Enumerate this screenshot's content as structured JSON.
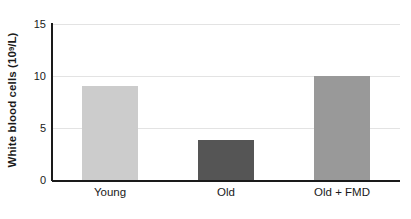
{
  "chart_data": {
    "type": "bar",
    "title": "",
    "xlabel": "",
    "ylabel": "White blood cells (10^9/L)",
    "ylabel_prefix": "White blood cells (10",
    "ylabel_exponent": "9",
    "ylabel_suffix": "/L)",
    "categories": [
      "Young",
      "Old",
      "Old + FMD"
    ],
    "values": [
      9.0,
      3.8,
      10.0
    ],
    "ylim": [
      0,
      15
    ],
    "yticks": [
      0,
      5,
      10,
      15
    ],
    "ytick_labels": [
      "0",
      "5",
      "10",
      "15"
    ],
    "grid": true,
    "grid_axis": "y",
    "legend": false,
    "bar_colors": [
      "#cccccc",
      "#555555",
      "#999999"
    ],
    "axis_color": "#1a1a1a",
    "gridline_color": "#e3e3e3",
    "background": "#ffffff"
  }
}
